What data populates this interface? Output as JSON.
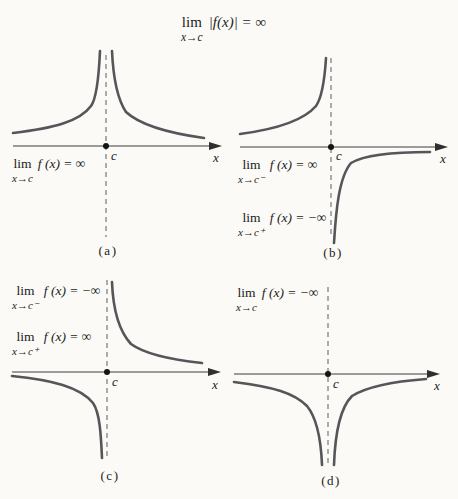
{
  "figure": {
    "title": {
      "lim": "lim",
      "sub": "x→c",
      "expr": "|f(x)| = ∞"
    },
    "colors": {
      "background": "#fbfaf6",
      "curve": "#55565a",
      "axis": "#3c3c3c",
      "dashed_asymptote": "#5c5c5c",
      "text": "#222222"
    },
    "graphs": {
      "a": {
        "caption": "(a)",
        "axis_label": "x",
        "point_label": "c",
        "behavior": "both branches rise to +∞ at x = c",
        "limits": [
          {
            "lim": "lim",
            "sub": "x→c",
            "expr": "f (x) = ∞"
          }
        ]
      },
      "b": {
        "caption": "(b)",
        "axis_label": "x",
        "point_label": "c",
        "behavior": "left branch rises to +∞, right branch falls to −∞ at x = c",
        "limits": [
          {
            "lim": "lim",
            "sub": "x→c⁻",
            "expr": "f (x) = ∞"
          },
          {
            "lim": "lim",
            "sub": "x→c⁺",
            "expr": "f (x) = −∞"
          }
        ]
      },
      "c": {
        "caption": "(c)",
        "axis_label": "x",
        "point_label": "c",
        "behavior": "left branch falls to −∞, right branch rises to +∞ at x = c",
        "limits": [
          {
            "lim": "lim",
            "sub": "x→c⁻",
            "expr": "f (x) = −∞"
          },
          {
            "lim": "lim",
            "sub": "x→c⁺",
            "expr": "f (x) = ∞"
          }
        ]
      },
      "d": {
        "caption": "(d)",
        "axis_label": "x",
        "point_label": "c",
        "behavior": "both branches fall to −∞ at x = c",
        "limits": [
          {
            "lim": "lim",
            "sub": "x→c",
            "expr": "f (x) = −∞"
          }
        ]
      }
    }
  }
}
